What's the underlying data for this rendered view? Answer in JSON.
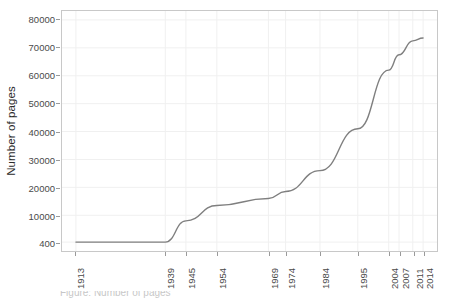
{
  "chart_data": {
    "type": "line",
    "title": "",
    "xlabel": "",
    "ylabel": "Number of pages",
    "x": [
      1913,
      1939,
      1945,
      1954,
      1969,
      1974,
      1984,
      1995,
      2004,
      2007,
      2011,
      2014
    ],
    "values": [
      400,
      400,
      8000,
      13500,
      16000,
      18500,
      26000,
      41000,
      62000,
      67500,
      72500,
      73500
    ],
    "series": [
      {
        "name": "Number of pages",
        "values": [
          400,
          400,
          8000,
          13500,
          16000,
          18500,
          26000,
          41000,
          62000,
          67500,
          72500,
          73500
        ]
      }
    ],
    "x_tick_labels": [
      "1913",
      "1939",
      "1945",
      "1954",
      "1969",
      "1974",
      "1984",
      "1995",
      "2004",
      "2007",
      "2011",
      "2014"
    ],
    "y_tick_labels": [
      "400",
      "10000",
      "20000",
      "30000",
      "40000",
      "50000",
      "60000",
      "70000",
      "80000"
    ],
    "y_tick_values": [
      400,
      10000,
      20000,
      30000,
      40000,
      50000,
      60000,
      70000,
      80000
    ],
    "ylim": [
      400,
      80000
    ],
    "xlim": [
      1913,
      2014
    ],
    "grid": true,
    "legend": "none",
    "line_color": "#7f7f7f",
    "grid_color": "#f0f0f0",
    "panel_border_color": "#c8c8c8",
    "background_color": "#ffffff",
    "caption": "Figure: Number of pages"
  },
  "axes": {
    "y_title": "Number of pages"
  }
}
